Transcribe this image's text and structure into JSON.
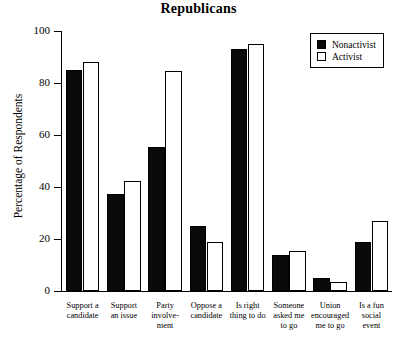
{
  "chart_data": {
    "type": "bar",
    "title": "Republicans",
    "xlabel": "",
    "ylabel": "Percentage of Respondents",
    "ylim": [
      0,
      100
    ],
    "yticks": [
      0,
      20,
      40,
      60,
      80,
      100
    ],
    "ytick_labels": [
      "0",
      "20",
      "40",
      "60",
      "80",
      "100"
    ],
    "grid": false,
    "legend_position": "top-right",
    "categories": [
      "Support a candidate",
      "Support an issue",
      "Party involve- ment",
      "Oppose a candidate",
      "Is right thing to do",
      "Someone asked me to go",
      "Union encouraged me to go",
      "Is a fun social event"
    ],
    "category_lines": [
      [
        "Support a",
        "candidate"
      ],
      [
        "Support",
        "an issue"
      ],
      [
        "Party",
        "involve-",
        "ment"
      ],
      [
        "Oppose a",
        "candidate"
      ],
      [
        "Is right",
        "thing to do"
      ],
      [
        "Someone",
        "asked me",
        "to go"
      ],
      [
        "Union",
        "encouraged",
        "me to go"
      ],
      [
        "Is a fun",
        "social",
        "event"
      ]
    ],
    "series": [
      {
        "name": "Nonactivist",
        "color": "#0a0a0a",
        "values": [
          85,
          37.5,
          55.5,
          25,
          93,
          14,
          5,
          19
        ]
      },
      {
        "name": "Activist",
        "color": "#ffffff",
        "values": [
          88,
          42.5,
          84.5,
          19,
          95,
          15.5,
          3.5,
          27
        ]
      }
    ]
  },
  "legend": {
    "items": [
      {
        "label": "Nonactivist",
        "swatch": "filled-square-icon"
      },
      {
        "label": "Activist",
        "swatch": "open-square-icon"
      }
    ]
  }
}
